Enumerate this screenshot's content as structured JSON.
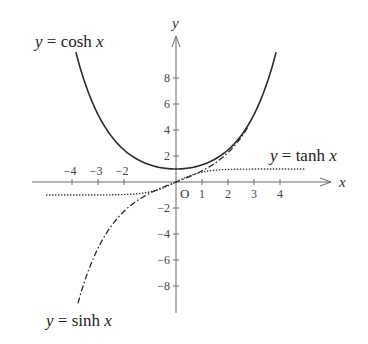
{
  "chart_data": {
    "type": "line",
    "title": "",
    "xlabel": "x",
    "ylabel": "y",
    "origin_label": "O",
    "x_ticks": [
      -4,
      -3,
      -2,
      1,
      2,
      3,
      4
    ],
    "x_tick_labels": [
      "−4",
      "−3",
      "−2",
      "1",
      "2",
      "3",
      "4"
    ],
    "y_ticks": [
      8,
      6,
      4,
      2,
      -2,
      -4,
      -6,
      -8
    ],
    "y_tick_labels": [
      "8",
      "6",
      "4",
      "2",
      "−2",
      "−4",
      "−6",
      "−8"
    ],
    "xlim": [
      -5.5,
      6
    ],
    "ylim": [
      -10,
      11
    ],
    "grid": false,
    "legend": "inline annotations",
    "series": [
      {
        "name": "y = cosh x",
        "function": "cosh",
        "style": "solid",
        "x": [
          -3.85,
          -3,
          -2,
          -1,
          0,
          1,
          2,
          3,
          3.85
        ],
        "y": [
          10.0,
          5.3,
          2.5,
          1.3,
          1.0,
          1.3,
          2.5,
          5.3,
          10.0
        ]
      },
      {
        "name": "y = sinh x",
        "function": "sinh",
        "style": "dash-dot",
        "x": [
          -3.77,
          -3,
          -2,
          -1,
          0,
          1,
          2,
          2.8
        ],
        "y": [
          -9.4,
          -5.2,
          -2.4,
          -0.86,
          0,
          0.86,
          2.4,
          4.4
        ]
      },
      {
        "name": "y = tanh x",
        "function": "tanh",
        "style": "dotted",
        "x": [
          -5,
          -3,
          -2,
          -1,
          0,
          1,
          2,
          3,
          5
        ],
        "y": [
          -1.0,
          -0.98,
          -0.92,
          -0.65,
          0,
          0.65,
          0.92,
          0.98,
          1.0
        ]
      }
    ],
    "annotations": [
      {
        "text": "y = cosh x",
        "position": "upper-left"
      },
      {
        "text": "y = tanh x",
        "position": "right, above x-axis"
      },
      {
        "text": "y = sinh x",
        "position": "lower-left"
      }
    ]
  },
  "labels": {
    "cosh": {
      "y": "y",
      "eq": " = ",
      "fn": "cosh ",
      "x": "x"
    },
    "sinh": {
      "y": "y",
      "eq": " = ",
      "fn": "sinh ",
      "x": "x"
    },
    "tanh": {
      "y": "y",
      "eq": " = ",
      "fn": "tanh ",
      "x": "x"
    }
  }
}
